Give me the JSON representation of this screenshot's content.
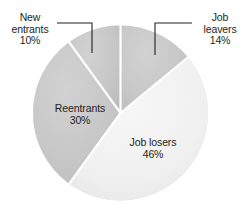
{
  "chart_data": {
    "type": "pie",
    "title": "",
    "labels": [
      "Job leavers",
      "Job losers",
      "Reentrants",
      "New entrants"
    ],
    "values": [
      14,
      46,
      30,
      10
    ],
    "value_suffix": "%",
    "slices": [
      {
        "name": "Job leavers",
        "value": 14,
        "value_text": "14%",
        "label_line1": "Job",
        "label_line2": "leavers",
        "label_line3": "14%",
        "color": "#c9c9c9",
        "label_placement": "outside-callout",
        "start_angle_deg": 0,
        "end_angle_deg": 50.4
      },
      {
        "name": "Job losers",
        "value": 46,
        "value_text": "46%",
        "label_line1": "Job losers",
        "label_line2": "46%",
        "color": "#f2f2f2",
        "label_placement": "inside",
        "start_angle_deg": 50.4,
        "end_angle_deg": 216.0
      },
      {
        "name": "Reentrants",
        "value": 30,
        "value_text": "30%",
        "label_line1": "Reentrants",
        "label_line2": "30%",
        "color": "#c9c9c9",
        "label_placement": "inside",
        "start_angle_deg": 216.0,
        "end_angle_deg": 324.0
      },
      {
        "name": "New entrants",
        "value": 10,
        "value_text": "10%",
        "label_line1": "New",
        "label_line2": "entrants",
        "label_line3": "10%",
        "color": "#c9c9c9",
        "label_placement": "outside-callout",
        "start_angle_deg": 324.0,
        "end_angle_deg": 360.0
      }
    ],
    "legend": "none",
    "grid": false,
    "background_color": "#ffffff",
    "divider_color": "#ffffff",
    "text_color": "#231f20"
  },
  "callouts": {
    "new_entrants": {
      "line1": "New",
      "line2": "entrants",
      "line3": "10%"
    },
    "job_leavers": {
      "line1": "Job",
      "line2": "leavers",
      "line3": "14%"
    }
  },
  "inner_labels": {
    "reentrants": {
      "line1": "Reentrants",
      "line2": "30%"
    },
    "job_losers": {
      "line1": "Job losers",
      "line2": "46%"
    }
  }
}
